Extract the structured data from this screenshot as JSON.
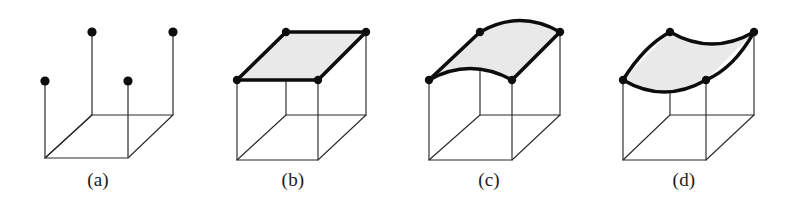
{
  "figure": {
    "width": 785,
    "height": 203,
    "background_color": "#ffffff",
    "line_color": "#2b2b2b",
    "emphasis_line_color": "#0d0d0d",
    "surface_fill_color": "#e9e9e9",
    "dot_color": "#0d0d0d",
    "caption_color": "#1a1a1a"
  },
  "panels": [
    {
      "id": "a",
      "caption": "(a)",
      "caption_x": 98,
      "caption_y": 186,
      "kind": "corner-points",
      "has_surface": false,
      "surface_filled": false,
      "dot_count": 4,
      "dot_radius": 4.6,
      "dots": [
        {
          "name": "front-left-dot",
          "x": 45,
          "y": 81
        },
        {
          "name": "back-left-dot",
          "x": 92,
          "y": 32
        },
        {
          "name": "front-right-dot",
          "x": 128,
          "y": 81
        },
        {
          "name": "back-right-dot",
          "x": 173,
          "y": 32
        }
      ],
      "stems": [
        {
          "name": "front-left-stem",
          "x1": 45,
          "y1": 81,
          "x2": 45,
          "y2": 158
        },
        {
          "name": "back-left-stem",
          "x1": 92,
          "y1": 32,
          "x2": 92,
          "y2": 115
        },
        {
          "name": "front-right-stem",
          "x1": 128,
          "y1": 81,
          "x2": 128,
          "y2": 158
        },
        {
          "name": "back-right-stem",
          "x1": 173,
          "y1": 32,
          "x2": 173,
          "y2": 115
        }
      ],
      "base": {
        "front_left": {
          "x": 45,
          "y": 158
        },
        "front_right": {
          "x": 128,
          "y": 158
        },
        "back_right": {
          "x": 173,
          "y": 115
        },
        "back_left": {
          "x": 92,
          "y": 115
        }
      }
    },
    {
      "id": "b",
      "caption": "(b)",
      "caption_x": 293,
      "caption_y": 186,
      "kind": "flat-patch",
      "has_surface": true,
      "surface_filled": true,
      "dot_count": 4,
      "dot_radius": 4.2,
      "top": {
        "front_left": {
          "x": 237,
          "y": 80
        },
        "front_right": {
          "x": 318,
          "y": 80
        },
        "back_right": {
          "x": 366,
          "y": 32
        },
        "back_left": {
          "x": 286,
          "y": 32
        }
      },
      "base": {
        "front_left": {
          "x": 237,
          "y": 160
        },
        "front_right": {
          "x": 318,
          "y": 160
        },
        "back_right": {
          "x": 366,
          "y": 115
        },
        "back_left": {
          "x": 286,
          "y": 115
        }
      }
    },
    {
      "id": "c",
      "caption": "(c)",
      "caption_x": 489,
      "caption_y": 186,
      "kind": "single-curved-patch",
      "has_surface": true,
      "surface_filled": true,
      "dot_count": 4,
      "dot_radius": 4.2,
      "top": {
        "front_left": {
          "x": 429,
          "y": 80
        },
        "front_right": {
          "x": 512,
          "y": 80
        },
        "back_right": {
          "x": 560,
          "y": 32
        },
        "back_left": {
          "x": 480,
          "y": 32
        }
      },
      "base": {
        "front_left": {
          "x": 429,
          "y": 160
        },
        "front_right": {
          "x": 512,
          "y": 160
        },
        "back_right": {
          "x": 560,
          "y": 115
        },
        "back_left": {
          "x": 480,
          "y": 115
        }
      },
      "curvature": "convex-upward along both front and back edges"
    },
    {
      "id": "d",
      "caption": "(d)",
      "caption_x": 684,
      "caption_y": 186,
      "kind": "saddle-patch",
      "has_surface": true,
      "surface_filled": true,
      "dot_count": 4,
      "dot_radius": 4.2,
      "top": {
        "front_left": {
          "x": 623,
          "y": 80
        },
        "front_right": {
          "x": 706,
          "y": 80
        },
        "back_right": {
          "x": 754,
          "y": 32
        },
        "back_left": {
          "x": 670,
          "y": 32
        }
      },
      "base": {
        "front_left": {
          "x": 623,
          "y": 160
        },
        "front_right": {
          "x": 706,
          "y": 160
        },
        "back_right": {
          "x": 754,
          "y": 115
        },
        "back_left": {
          "x": 670,
          "y": 115
        }
      },
      "curvature": "concave-downward along both front and back edges"
    }
  ]
}
